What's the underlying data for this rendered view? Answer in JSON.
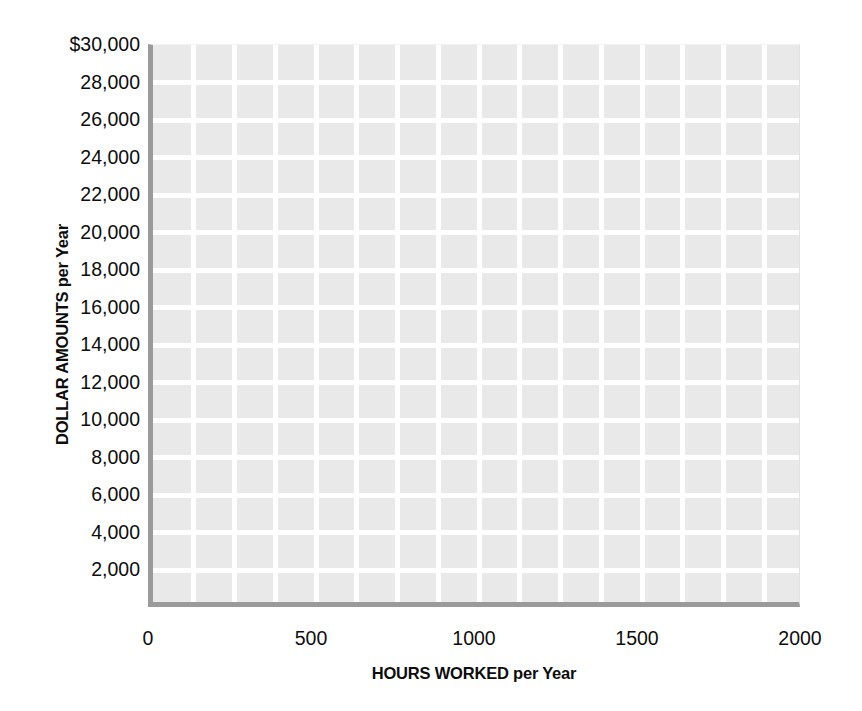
{
  "chart_data": {
    "type": "line",
    "title": "",
    "subtitle": "",
    "xlabel": "HOURS WORKED per Year",
    "ylabel": "DOLLAR AMOUNTS per Year",
    "xlim": [
      0,
      2000
    ],
    "ylim": [
      0,
      30000
    ],
    "xticks": [
      0,
      500,
      1000,
      1500,
      2000
    ],
    "xticklabels": [
      "0",
      "500",
      "1000",
      "1500",
      "2000"
    ],
    "yticks": [
      2000,
      4000,
      6000,
      8000,
      10000,
      12000,
      14000,
      16000,
      18000,
      20000,
      22000,
      24000,
      26000,
      28000,
      30000
    ],
    "yticklabels": [
      "2,000",
      "4,000",
      "6,000",
      "8,000",
      "10,000",
      "12,000",
      "14,000",
      "16,000",
      "18,000",
      "20,000",
      "22,000",
      "24,000",
      "26,000",
      "28,000",
      "$30,000"
    ],
    "series": [],
    "annotations": [],
    "legend": null,
    "legend_position": "none",
    "grid": true,
    "grid_minor_x_step": 125,
    "grid_major_y_step": 2000,
    "colors": {
      "plot_background": "#e9e9e9",
      "grid_line": "#ffffff",
      "axis_line": "#9a9a9a",
      "text": "#0d0d0d",
      "page_background": "#ffffff"
    }
  }
}
